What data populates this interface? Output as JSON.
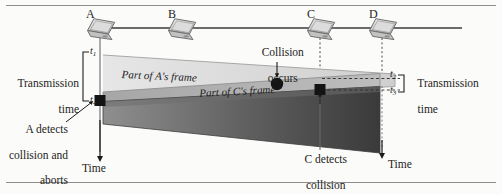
{
  "figure": {
    "type": "timing-diagram",
    "topic": "CSMA/CD collision detection and abort timeline",
    "background_color": "#fbfbf9",
    "rule_color": "#8d8d8d"
  },
  "bus": {
    "label": "ethernet-bus-line",
    "color": "#3b3b3b"
  },
  "nodes": [
    {
      "id": "A",
      "label": "A",
      "x": 100,
      "icon": "laptop-icon"
    },
    {
      "id": "B",
      "label": "B",
      "x": 181,
      "icon": "laptop-icon"
    },
    {
      "id": "C",
      "label": "C",
      "x": 320,
      "icon": "laptop-icon"
    },
    {
      "id": "D",
      "label": "D",
      "x": 382,
      "icon": "laptop-icon"
    }
  ],
  "time_marks": {
    "t1": "t",
    "t1_sub": "1",
    "t2": "t",
    "t2_sub": "2",
    "t3": "t",
    "t3_sub": "3",
    "t4": "t",
    "t4_sub": "4"
  },
  "annotations": {
    "transmission_time_left_line1": "Transmission",
    "transmission_time_left_line2": "time",
    "transmission_time_right_line1": "Transmission",
    "transmission_time_right_line2": "time",
    "collision_line1": "Collision",
    "collision_line2": "occurs",
    "frame_a": "Part of A's frame",
    "frame_c": "Part of C's frame",
    "a_detects_line1": "A detects",
    "a_detects_line2": "collision and",
    "a_detects_line3": "aborts",
    "c_detects_line1": "C detects",
    "c_detects_line2": "collision",
    "c_detects_line3": "and aborts",
    "time_axis_left": "Time",
    "time_axis_right": "Time"
  },
  "colors": {
    "frame_a_fill": "#d9d9d9",
    "frame_c_fill": "#b0b0b0",
    "dark_region": "#4c4c4c",
    "marker_black": "#111111",
    "laptop_body": "#c9c9c9",
    "laptop_shade": "#9a9a9a"
  }
}
